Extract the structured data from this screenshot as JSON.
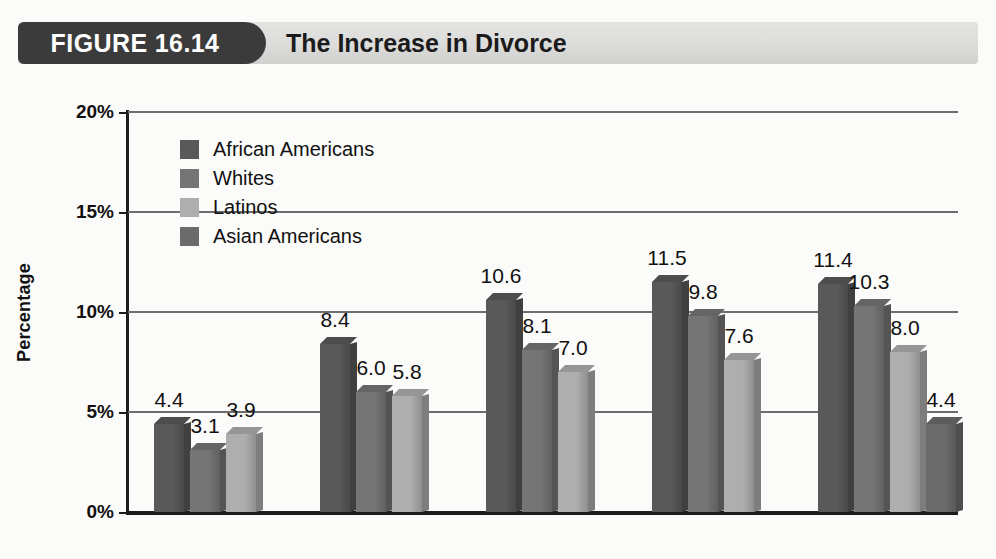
{
  "header": {
    "figure_tab_label": "FIGURE 16.14",
    "title": "The Increase in Divorce"
  },
  "chart_data": {
    "type": "bar",
    "title": "The Increase in Divorce",
    "xlabel": "",
    "ylabel": "Percentage",
    "ylim": [
      0,
      20
    ],
    "ytick_labels": [
      "0%",
      "5%",
      "10%",
      "15%",
      "20%"
    ],
    "ytick_values": [
      0,
      5,
      10,
      15,
      20
    ],
    "grid": true,
    "legend_position": "inside-top-left",
    "categories": [
      "1970",
      "1980",
      "1990",
      "2000",
      "2010*"
    ],
    "series": [
      {
        "name": "African Americans",
        "color": "#595959",
        "values": [
          4.4,
          8.4,
          10.6,
          11.5,
          11.4
        ],
        "labels": [
          "4.4",
          "8.4",
          "10.6",
          "11.5",
          "11.4"
        ]
      },
      {
        "name": "Whites",
        "color": "#757575",
        "values": [
          3.1,
          6.0,
          8.1,
          9.8,
          10.3
        ],
        "labels": [
          "3.1",
          "6.0",
          "8.1",
          "9.8",
          "10.3"
        ]
      },
      {
        "name": "Latinos",
        "color": "#aeaeae",
        "values": [
          3.9,
          5.8,
          7.0,
          7.6,
          8.0
        ],
        "labels": [
          "3.9",
          "5.8",
          "7.0",
          "7.6",
          "8.0"
        ]
      },
      {
        "name": "Asian Americans",
        "color": "#6b6b6b",
        "values": [
          null,
          null,
          null,
          null,
          4.4
        ],
        "labels": [
          "",
          "",
          "",
          "",
          "4.4"
        ]
      }
    ]
  }
}
